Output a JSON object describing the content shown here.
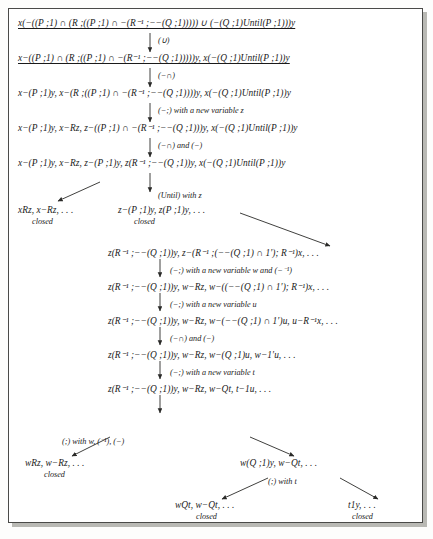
{
  "figure": {
    "kind": "tableau-proof-tree",
    "width": 433,
    "height": 539,
    "border_color": "#4a4a48",
    "shadow_color": "#b9b9b4",
    "text_color": "#1a1a1a"
  },
  "nodes": {
    "n1": "x(−((P ;1) ∩ (R ;((P ;1) ∩ −(R⁻¹ ;−−(Q ;1))))) ∪ (−(Q ;1)Until(P ;1)))y",
    "n2": "x−((P ;1) ∩ (R ;((P ;1) ∩ −(R⁻¹ ;−−(Q ;1)))))y, x(−(Q ;1)Until(P ;1))y",
    "n3": "x−(P ;1)y, x−(R ;((P ;1) ∩ −(R⁻¹ ;−−(Q ;1))))y, x(−(Q ;1)Until(P ;1))y",
    "n4": "x−(P ;1)y, x−Rz, z−((P ;1) ∩ −(R⁻¹ ;−−(Q ;1)))y, x(−(Q ;1)Until(P ;1))y",
    "n5": "x−(P ;1)y, x−Rz, z−(P ;1)y, z(R⁻¹ ;−−(Q ;1))y, x(−(Q ;1)Until(P ;1))y",
    "n6_left": "xRz, x−Rz, . . .",
    "n6_right": "z−(P ;1)y, z(P ;1)y, . . .",
    "n7": "z(R⁻¹ ;−−(Q ;1))y, z−(R⁻¹ ;(−−(Q ;1) ∩ 1′); R⁻¹)x, . . .",
    "n8": "z(R⁻¹ ;−−(Q ;1))y, w−Rz, w−((−−(Q ;1) ∩ 1′); R⁻¹)x, . . .",
    "n9": "z(R⁻¹ ;−−(Q ;1))y, w−Rz, w−(−−(Q ;1) ∩ 1′)u, u−R⁻¹x, . . .",
    "n10": "z(R⁻¹ ;−−(Q ;1))y, w−Rz, w−(Q ;1)u, w−1′u, . . .",
    "n11": "z(R⁻¹ ;−−(Q ;1))y, w−Rz, w−Qt, t−1u, . . .",
    "n12_left": "wRz, w−Rz, . . .",
    "n12_right": "w(Q ;1)y, w−Qt, . . .",
    "n13_left": "wQt, w−Qt, . . .",
    "n13_right": "t1y, . . ."
  },
  "rule_labels": {
    "r1": "(∪)",
    "r2": "(−∩)",
    "r3": "(−;) with a new variable z",
    "r4": "(−∩) and (−)",
    "r5": "(Until) with z",
    "r6": "(−;) with a new variable w and (−⁻¹)",
    "r7": "(−;) with a new variable u",
    "r8": "(−∩) and (−)",
    "r9": "(−;) with a new variable t",
    "r10": "(;) with w, (⁻¹), (−)",
    "r11": "(;) with t"
  },
  "closed_markers": {
    "c1": "closed",
    "c2": "closed",
    "c3": "closed",
    "c4": "closed",
    "c5": "closed"
  }
}
